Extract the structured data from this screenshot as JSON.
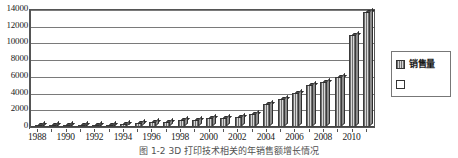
{
  "chart_data": {
    "type": "bar",
    "title": "",
    "xlabel": "",
    "ylabel": "",
    "ylim": [
      0,
      14000
    ],
    "ytick_step": 2000,
    "yticks": [
      "0",
      "2000",
      "4000",
      "6000",
      "8000",
      "10000",
      "12000",
      "14000"
    ],
    "grid": true,
    "legend_position": "right-outside",
    "categories": [
      "1988",
      "1989",
      "1990",
      "1991",
      "1992",
      "1993",
      "1994",
      "1995",
      "1996",
      "1997",
      "1998",
      "1999",
      "2000",
      "2001",
      "2002",
      "2003",
      "2004",
      "2005",
      "2006",
      "2007",
      "2008",
      "2009",
      "2010",
      "2011"
    ],
    "xtick_labels": [
      "1988",
      "1990",
      "1992",
      "1994",
      "1996",
      "1998",
      "2000",
      "2002",
      "2004",
      "2006",
      "2008",
      "2010"
    ],
    "series": [
      {
        "name": "销售量",
        "values": [
          120,
          140,
          160,
          180,
          210,
          240,
          330,
          430,
          620,
          650,
          780,
          880,
          1030,
          1060,
          1200,
          1600,
          2750,
          3400,
          4100,
          5000,
          5400,
          6000,
          11000,
          13800
        ]
      }
    ]
  },
  "legend": {
    "entries": [
      {
        "label": "销售量",
        "swatch": "filled"
      },
      {
        "label": "",
        "swatch": "empty"
      }
    ]
  },
  "caption": {
    "text": "图 1-2  3D 打印技术相关的年销售额增长情况"
  }
}
